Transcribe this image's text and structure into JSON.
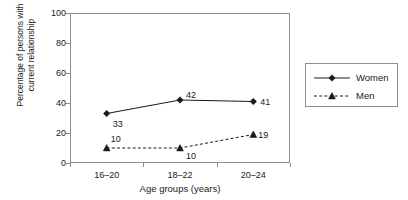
{
  "chart_data": {
    "type": "line",
    "title": "",
    "xlabel": "Age groups (years)",
    "ylabel_line1": "Percentage of persons with",
    "ylabel_line2": "current relationship",
    "categories": [
      "16–20",
      "18–22",
      "20–24"
    ],
    "ylim": [
      0,
      100
    ],
    "yticks": [
      100,
      80,
      60,
      40,
      20,
      0
    ],
    "grid": false,
    "legend_position": "right",
    "series": [
      {
        "name": "Women",
        "values": [
          33,
          42,
          41
        ],
        "marker": "diamond",
        "linestyle": "solid",
        "color": "#1a1a1a"
      },
      {
        "name": "Men",
        "values": [
          10,
          10,
          19
        ],
        "marker": "triangle",
        "linestyle": "dashed",
        "color": "#1a1a1a"
      }
    ],
    "point_labels": [
      {
        "series": "Women",
        "category": "16–20",
        "text": "33"
      },
      {
        "series": "Women",
        "category": "18–22",
        "text": "42"
      },
      {
        "series": "Women",
        "category": "20–24",
        "text": "41"
      },
      {
        "series": "Men",
        "category": "16–20",
        "text": "10"
      },
      {
        "series": "Men",
        "category": "18–22",
        "text": "10"
      },
      {
        "series": "Men",
        "category": "20–24",
        "text": "19"
      }
    ],
    "colors": {
      "axis": "#8d8d8d",
      "text": "#1a1a1a",
      "background": "#ffffff"
    }
  }
}
